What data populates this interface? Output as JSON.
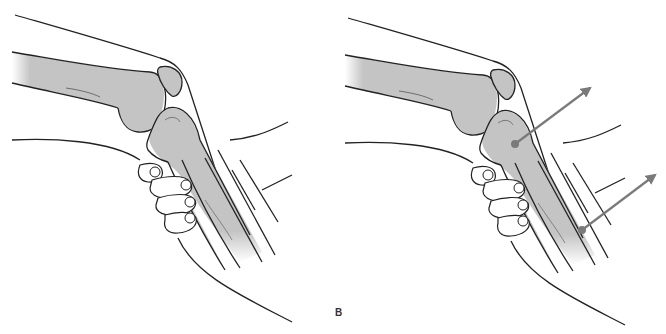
{
  "figure": {
    "panels": [
      {
        "id": "A",
        "label": "",
        "arrows": []
      },
      {
        "id": "B",
        "label": "B",
        "arrows": [
          {
            "from": [
              515,
              144
            ],
            "to": [
              590,
              88
            ]
          },
          {
            "from": [
              582,
              230
            ],
            "to": [
              655,
              175
            ]
          }
        ]
      }
    ],
    "caption": "",
    "colors": {
      "bone_fill": "#c4c4c4",
      "outline": "#222222",
      "arrow": "#7a7a7a",
      "background": "#ffffff"
    }
  }
}
